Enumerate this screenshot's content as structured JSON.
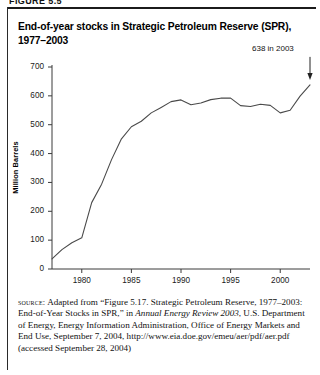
{
  "figure": {
    "cutoff_header": "FIGURE 5.5",
    "title_line1": "End-of-year stocks in Strategic Petroleum Reserve (SPR),",
    "title_line2": "1977–2003"
  },
  "source": {
    "label": "source:",
    "text_part1": " Adapted from “Figure 5.17. Strategic Petroleum Reserve, 1977–2003: End-of-Year Stocks in SPR,” in ",
    "italic1": "Annual Energy Review 2003",
    "text_part2": ", U.S. Department of Energy, Energy Information Administration, Office of Energy Markets and End Use, September 7, 2004, http://www.eia.doe.gov/emeu/aer/pdf/aer.pdf (accessed September 28, 2004)"
  },
  "chart_data": {
    "type": "line",
    "title": "End-of-year stocks in Strategic Petroleum Reserve (SPR), 1977–2003",
    "xlabel": "",
    "ylabel": "Million Barrels",
    "xlim": [
      1977,
      2003
    ],
    "ylim": [
      0,
      700
    ],
    "ytick_labels": [
      "0",
      "100",
      "200",
      "300",
      "400",
      "500",
      "600",
      "700"
    ],
    "yticks": [
      0,
      100,
      200,
      300,
      400,
      500,
      600,
      700
    ],
    "xtick_labels": [
      "1980",
      "1985",
      "1990",
      "1995",
      "2000"
    ],
    "xticks": [
      1980,
      1985,
      1990,
      1995,
      2000
    ],
    "grid": false,
    "legend": "none",
    "line_color": "#4a4a4a",
    "annotation": {
      "text": "638 in 2003",
      "x": 2003,
      "y": 638
    },
    "x": [
      1977,
      1978,
      1979,
      1980,
      1981,
      1982,
      1983,
      1984,
      1985,
      1986,
      1987,
      1988,
      1989,
      1990,
      1991,
      1992,
      1993,
      1994,
      1995,
      1996,
      1997,
      1998,
      1999,
      2000,
      2001,
      2002,
      2003
    ],
    "values": [
      35,
      67,
      91,
      108,
      230,
      294,
      379,
      451,
      493,
      512,
      541,
      560,
      580,
      586,
      569,
      575,
      587,
      592,
      592,
      566,
      563,
      571,
      567,
      541,
      550,
      599,
      638
    ],
    "series": [
      {
        "name": "End-of-year SPR stocks",
        "values": [
          35,
          67,
          91,
          108,
          230,
          294,
          379,
          451,
          493,
          512,
          541,
          560,
          580,
          586,
          569,
          575,
          587,
          592,
          592,
          566,
          563,
          571,
          567,
          541,
          550,
          599,
          638
        ]
      }
    ]
  }
}
